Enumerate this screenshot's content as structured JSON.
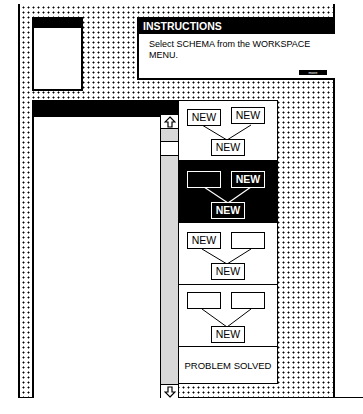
{
  "small_window": {
    "title": ""
  },
  "instructions": {
    "title": "INSTRUCTIONS",
    "text": "Select SCHEMA from the WORKSPACE MENU.",
    "more_button": "more"
  },
  "main_window": {
    "title": ""
  },
  "scrollbar": {
    "up_icon": "up-arrow",
    "down_icon": "down-arrow"
  },
  "schemas": [
    {
      "selected": false,
      "top_left": "NEW",
      "top_right": "NEW",
      "bottom": "NEW"
    },
    {
      "selected": true,
      "top_left": "",
      "top_right": "NEW",
      "bottom": "NEW"
    },
    {
      "selected": false,
      "top_left": "NEW",
      "top_right": "",
      "bottom": "NEW"
    },
    {
      "selected": false,
      "top_left": "",
      "top_right": "",
      "bottom": "NEW"
    }
  ],
  "problem_solved": {
    "label": "PROBLEM SOLVED"
  },
  "colors": {
    "foreground": "#000000",
    "background": "#ffffff",
    "scroll_gray": "#d8d8d8"
  }
}
